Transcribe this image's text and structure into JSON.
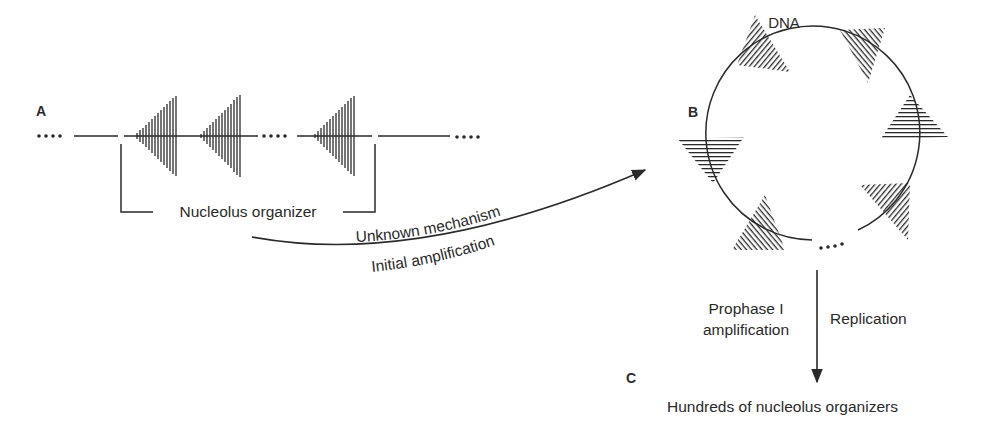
{
  "figure": {
    "panels": {
      "a": {
        "label": "A",
        "bracket_label": "Nucleolus organizer"
      },
      "b": {
        "label": "B",
        "dna_label": "DNA"
      },
      "c": {
        "label": "C",
        "result_label": "Hundreds of nucleolus organizers"
      }
    },
    "arrows": {
      "a_to_b": {
        "upper_label": "Unknown mechanism",
        "lower_label": "Initial amplification"
      },
      "b_to_c": {
        "left_label_line1": "Prophase I",
        "left_label_line2": "amplification",
        "right_label": "Replication"
      }
    },
    "colors": {
      "ink": "#2a2a2a",
      "background": "#ffffff"
    }
  }
}
